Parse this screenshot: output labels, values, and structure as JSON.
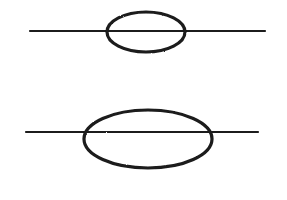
{
  "canvas": {
    "width": 287,
    "height": 200,
    "background": "#ffffff"
  },
  "style": {
    "ink_color": "#1a1a1a",
    "line_width": 2.2,
    "ellipse_width": 3.2
  },
  "figures": [
    {
      "name": "small-ellipse-on-line",
      "line": {
        "x1": 30,
        "y1": 31,
        "x2": 265,
        "y2": 31
      },
      "ellipse": {
        "cx": 146,
        "cy": 32,
        "rx": 39,
        "ry": 20
      }
    },
    {
      "name": "large-ellipse-on-line",
      "line": {
        "x1": 26,
        "y1": 132,
        "x2": 258,
        "y2": 132
      },
      "ellipse": {
        "cx": 148,
        "cy": 139,
        "rx": 64,
        "ry": 29
      }
    }
  ]
}
